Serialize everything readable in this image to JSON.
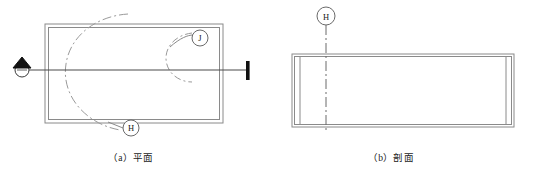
{
  "sheet": {
    "title": "",
    "background": "#ffffff",
    "line_color": "#8a8a8a",
    "dark_line_color": "#5a5a5a",
    "text_color": "#1a1a1a",
    "marker_fill": "#111111"
  },
  "figures": [
    {
      "id": "figure-a",
      "caption": "（a）平面",
      "caption_label": "（a）",
      "caption_text": "平面",
      "kind": "plan-view",
      "callouts": [
        {
          "label": "J",
          "cx": 200,
          "cy": 38,
          "r": 8
        },
        {
          "label": "H",
          "cx": 131,
          "cy": 128,
          "r": 8
        }
      ],
      "section_marker": {
        "label": "",
        "circle_cx": 22,
        "circle_cy": 70,
        "circle_r": 7,
        "arrow": "up-triangle",
        "line_start_x": 22,
        "line_end_x": 248,
        "line_y": 70,
        "end_bar_x": 248,
        "end_bar_top": 62,
        "end_bar_bottom": 80
      }
    },
    {
      "id": "figure-b",
      "caption": "（b）剖面",
      "caption_label": "（b）",
      "caption_text": "剖面",
      "kind": "section-view",
      "callouts": [
        {
          "label": "H",
          "cx": 326,
          "cy": 16,
          "r": 9
        }
      ]
    }
  ],
  "icons": {
    "section_arrow": "up-triangle-arrow-icon",
    "callout_bubble": "circle-callout-icon",
    "centerline": "dash-dot-centerline-icon",
    "swing_arc": "dash-dot-arc-icon"
  }
}
